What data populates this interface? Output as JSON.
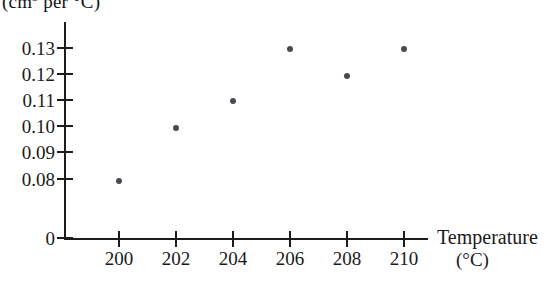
{
  "chart_data": {
    "type": "scatter",
    "title": "",
    "xlabel": "Temperature",
    "xlabel_unit": "(°C)",
    "ylabel_unit_prefix": "(cm",
    "ylabel_unit_sup": "3",
    "ylabel_unit_suffix": " per °C)",
    "x": [
      200,
      202,
      204,
      206,
      208,
      210
    ],
    "values": [
      0.08,
      0.1,
      0.11,
      0.13,
      0.12,
      0.13
    ],
    "points": [
      {
        "x": 200,
        "y": 0.08
      },
      {
        "x": 202,
        "y": 0.1
      },
      {
        "x": 204,
        "y": 0.11
      },
      {
        "x": 206,
        "y": 0.13
      },
      {
        "x": 208,
        "y": 0.12
      },
      {
        "x": 210,
        "y": 0.13
      }
    ],
    "xticks": [
      "200",
      "202",
      "204",
      "206",
      "208",
      "210"
    ],
    "yticks": [
      "0.13",
      "0.12",
      "0.11",
      "0.10",
      "0.09",
      "0.08",
      "0"
    ],
    "xlim": [
      199,
      211
    ],
    "ylim": [
      0,
      0.135
    ],
    "grid": false,
    "legend": null,
    "marker_color": "#4a4a52",
    "axis_color": "#1c1c1c"
  },
  "axes": {
    "y_unit_caption": "(cm3 per °C)",
    "x_title": "Temperature",
    "x_unit": "(°C)"
  },
  "yticks": [
    {
      "label": "0.13",
      "top": 48
    },
    {
      "label": "0.12",
      "top": 74
    },
    {
      "label": "0.11",
      "top": 100
    },
    {
      "label": "0.10",
      "top": 126
    },
    {
      "label": "0.09",
      "top": 152
    },
    {
      "label": "0.08",
      "top": 179
    },
    {
      "label": "0",
      "top": 238
    }
  ],
  "xticks": [
    {
      "label": "200",
      "left": 119
    },
    {
      "label": "202",
      "left": 176
    },
    {
      "label": "204",
      "left": 233
    },
    {
      "label": "206",
      "left": 290
    },
    {
      "label": "208",
      "left": 347
    },
    {
      "label": "210",
      "left": 404
    }
  ],
  "datapoints": [
    {
      "name": "point-200",
      "left": 119,
      "top": 181,
      "x": "200",
      "y": "0.08"
    },
    {
      "name": "point-202",
      "left": 176,
      "top": 128,
      "x": "202",
      "y": "0.10"
    },
    {
      "name": "point-204",
      "left": 233,
      "top": 101,
      "x": "204",
      "y": "0.11"
    },
    {
      "name": "point-206",
      "left": 290,
      "top": 49,
      "x": "206",
      "y": "0.13"
    },
    {
      "name": "point-208",
      "left": 347,
      "top": 76,
      "x": "208",
      "y": "0.12"
    },
    {
      "name": "point-210",
      "left": 404,
      "top": 49,
      "x": "210",
      "y": "0.13"
    }
  ]
}
